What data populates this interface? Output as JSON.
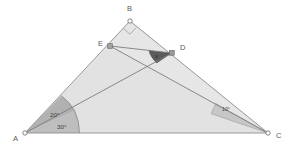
{
  "figure": {
    "kind": "geometry-diagram",
    "title": "",
    "canvas": {
      "width": 294,
      "height": 153
    },
    "background_color": "#ffffff",
    "stroke_color": "#8a8a8a",
    "fill_color": "#e4e4e4",
    "wedge_color": "#9a9a9a",
    "wedge_dark_color": "#4f4f4f",
    "vertex_marker_color": "#ffffff",
    "vertex_marker_stroke": "#6f6f6f"
  },
  "points": {
    "A": {
      "label": "A",
      "x": 25,
      "y": 133,
      "label_x": 13,
      "label_y": 141
    },
    "B": {
      "label": "B",
      "x": 130,
      "y": 21,
      "label_x": 127,
      "label_y": 11
    },
    "C": {
      "label": "C",
      "x": 268,
      "y": 133,
      "label_x": 276,
      "label_y": 138
    },
    "D": {
      "label": "D",
      "x": 172,
      "y": 53,
      "label_x": 180,
      "label_y": 50
    },
    "E": {
      "label": "E",
      "x": 110,
      "y": 46,
      "label_x": 98,
      "label_y": 46
    }
  },
  "segments": [
    {
      "name": "side-AB",
      "from": "A",
      "to": "B"
    },
    {
      "name": "side-BC",
      "from": "B",
      "to": "C"
    },
    {
      "name": "side-AC",
      "from": "A",
      "to": "C"
    },
    {
      "name": "segment-ED",
      "from": "E",
      "to": "D"
    },
    {
      "name": "segment-AD",
      "from": "A",
      "to": "D"
    },
    {
      "name": "segment-EC",
      "from": "E",
      "to": "C"
    }
  ],
  "angles": [
    {
      "name": "angle-at-A-upper",
      "label": "20°",
      "vertex": "A",
      "value": 20,
      "label_x": 50,
      "label_y": 117
    },
    {
      "name": "angle-at-A-lower",
      "label": "30°",
      "vertex": "A",
      "value": 30,
      "label_x": 57,
      "label_y": 129
    },
    {
      "name": "angle-at-C",
      "label": "10°",
      "vertex": "C",
      "value": 10,
      "label_x": 222,
      "label_y": 111
    },
    {
      "name": "angle-at-D-unknown",
      "label": "x",
      "vertex": "D",
      "value": null,
      "label_x": 155,
      "label_y": 58
    }
  ],
  "markers": [
    {
      "name": "right-angle-marker-at-B",
      "at": "B",
      "type": "right-angle",
      "label": ""
    }
  ]
}
